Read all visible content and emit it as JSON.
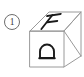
{
  "figure": {
    "type": "line-drawing",
    "index_label": "1",
    "index_label_style": "circled",
    "line_color": "#9a9a9a",
    "glyph_color": "#1a1a1a",
    "background_color": "#ffffff"
  },
  "cube": {
    "faces": [
      {
        "name": "top",
        "shape": "parallelogram",
        "letter": "F",
        "letter_orientation": "slanted-italic"
      },
      {
        "name": "front",
        "shape": "square",
        "letter": "D",
        "letter_orientation": "rotated-90-ccw"
      },
      {
        "name": "right",
        "shape": "parallelogram",
        "letter": "",
        "letter_orientation": "none"
      }
    ]
  }
}
